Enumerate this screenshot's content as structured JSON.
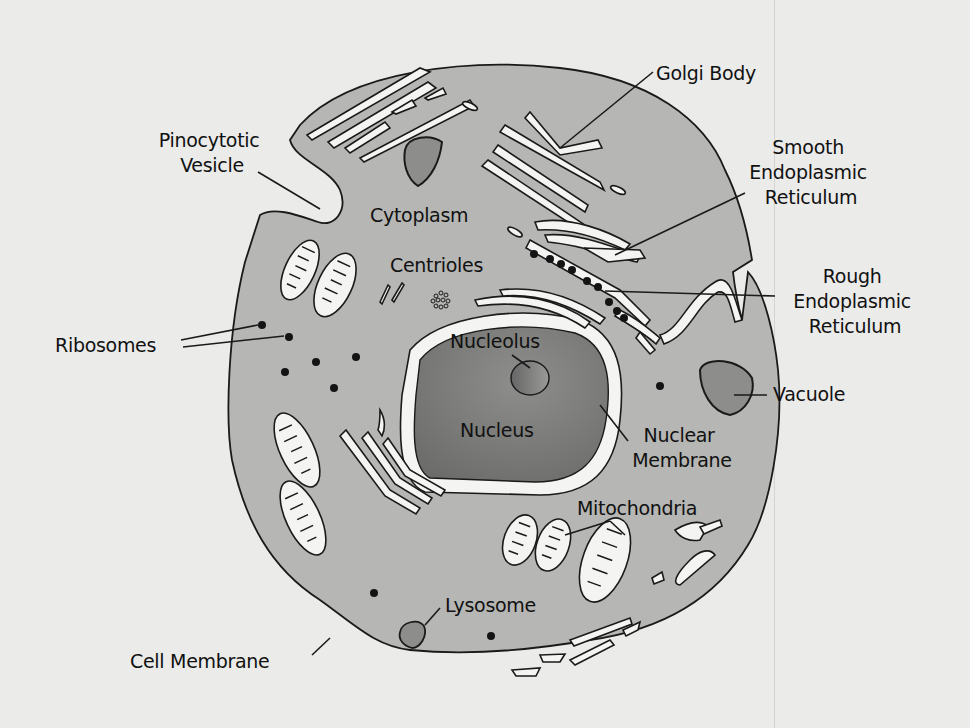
{
  "diagram": {
    "colors": {
      "background": "#ebebea",
      "cytoplasm": "#b6b6b4",
      "nucleus": "#7f7f7d",
      "nuclear_membrane": "#f4f4f2",
      "organelle_fill": "#f4f4f2",
      "vacuole": "#8d8d8b",
      "outline": "#1a1a1a"
    },
    "labels": {
      "golgi_body": "Golgi Body",
      "smooth_er": [
        "Smooth",
        "Endoplasmic",
        "Reticulum"
      ],
      "rough_er": [
        "Rough",
        "Endoplasmic",
        "Reticulum"
      ],
      "pinocytotic_vesicle": [
        "Pinocytotic",
        "Vesicle"
      ],
      "cytoplasm": "Cytoplasm",
      "centrioles": "Centrioles",
      "ribosomes": "Ribosomes",
      "nucleolus": "Nucleolus",
      "nucleus": "Nucleus",
      "vacuole": "Vacuole",
      "nuclear_membrane": [
        "Nuclear",
        "Membrane"
      ],
      "mitochondria": "Mitochondria",
      "lysosome": "Lysosome",
      "cell_membrane": "Cell Membrane"
    }
  }
}
